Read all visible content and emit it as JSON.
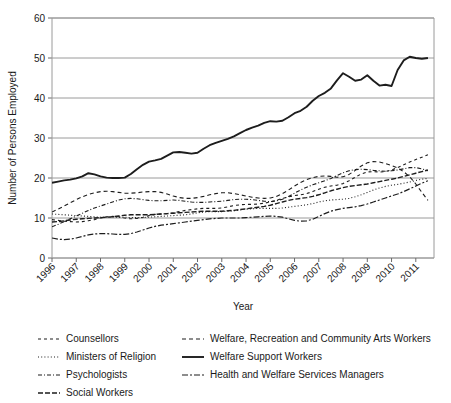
{
  "chart_data": {
    "type": "line",
    "title": "",
    "xlabel": "Year",
    "ylabel": "Number of Persons Employed",
    "xlim": [
      1996,
      2011.75
    ],
    "ylim": [
      0,
      60
    ],
    "yticks": [
      0,
      10,
      20,
      30,
      40,
      50,
      60
    ],
    "xticks": [
      1996,
      1997,
      1998,
      1999,
      2000,
      2001,
      2002,
      2003,
      2004,
      2005,
      2006,
      2007,
      2008,
      2009,
      2010,
      2011
    ],
    "grid": "horizontal",
    "legend_position": "below",
    "x": [
      1996,
      1996.25,
      1996.5,
      1996.75,
      1997,
      1997.25,
      1997.5,
      1997.75,
      1998,
      1998.25,
      1998.5,
      1998.75,
      1999,
      1999.25,
      1999.5,
      1999.75,
      2000,
      2000.25,
      2000.5,
      2000.75,
      2001,
      2001.25,
      2001.5,
      2001.75,
      2002,
      2002.25,
      2002.5,
      2002.75,
      2003,
      2003.25,
      2003.5,
      2003.75,
      2004,
      2004.25,
      2004.5,
      2004.75,
      2005,
      2005.25,
      2005.5,
      2005.75,
      2006,
      2006.25,
      2006.5,
      2006.75,
      2007,
      2007.25,
      2007.5,
      2007.75,
      2008,
      2008.25,
      2008.5,
      2008.75,
      2009,
      2009.25,
      2009.5,
      2009.75,
      2010,
      2010.25,
      2010.5,
      2010.75,
      2011,
      2011.25,
      2011.5
    ],
    "series": [
      {
        "name": "Counsellors",
        "dash": "3,3",
        "width": 1.1,
        "values": [
          9.6,
          9.4,
          9.2,
          9.1,
          9.0,
          9.1,
          9.3,
          9.6,
          10.0,
          10.3,
          10.4,
          10.3,
          10.0,
          9.8,
          9.9,
          10.2,
          10.6,
          10.9,
          11.0,
          11.1,
          11.3,
          11.6,
          11.9,
          12.1,
          12.3,
          12.4,
          12.4,
          12.4,
          12.5,
          12.8,
          13.1,
          13.3,
          13.4,
          13.4,
          13.5,
          13.7,
          14.0,
          14.4,
          14.9,
          15.3,
          15.6,
          15.8,
          16.1,
          16.6,
          17.2,
          17.7,
          18.0,
          18.2,
          18.6,
          19.3,
          20.2,
          21.0,
          21.5,
          21.6,
          21.5,
          21.6,
          22.0,
          22.6,
          23.3,
          24.0,
          24.6,
          25.2,
          25.8
        ]
      },
      {
        "name": "Ministers of Religion",
        "dash": "1,2.2",
        "width": 1.1,
        "values": [
          11.0,
          10.9,
          10.8,
          10.7,
          10.6,
          10.5,
          10.4,
          10.3,
          10.2,
          10.2,
          10.2,
          10.2,
          10.2,
          10.1,
          10.1,
          10.1,
          10.2,
          10.3,
          10.4,
          10.5,
          10.6,
          10.7,
          10.8,
          11.0,
          11.3,
          11.5,
          11.6,
          11.6,
          11.6,
          11.7,
          11.8,
          12.0,
          12.2,
          12.3,
          12.4,
          12.4,
          12.4,
          12.4,
          12.5,
          12.7,
          12.9,
          13.1,
          13.3,
          13.6,
          14.0,
          14.3,
          14.5,
          14.6,
          14.7,
          14.9,
          15.3,
          15.8,
          16.4,
          17.0,
          17.5,
          17.9,
          18.2,
          18.4,
          18.7,
          19.0,
          19.4,
          19.7,
          19.9
        ]
      },
      {
        "name": "Psychologists",
        "dash": "4,2,1,2",
        "width": 1.1,
        "values": [
          7.8,
          8.4,
          9.1,
          9.8,
          10.5,
          11.2,
          11.9,
          12.5,
          13.0,
          13.5,
          14.0,
          14.5,
          14.8,
          14.9,
          14.8,
          14.6,
          14.4,
          14.3,
          14.3,
          14.4,
          14.5,
          14.4,
          14.2,
          14.0,
          13.9,
          13.9,
          14.0,
          14.1,
          14.2,
          14.4,
          14.6,
          14.7,
          14.7,
          14.6,
          14.4,
          14.2,
          14.1,
          14.3,
          14.7,
          15.4,
          16.2,
          17.0,
          17.7,
          18.3,
          18.8,
          19.3,
          19.9,
          20.6,
          21.3,
          21.8,
          22.1,
          22.2,
          22.1,
          21.9,
          21.8,
          21.7,
          21.8,
          22.0,
          22.3,
          22.6,
          22.6,
          22.3,
          21.8
        ]
      },
      {
        "name": "Social Workers",
        "dash": "5,2",
        "width": 1.4,
        "values": [
          9.0,
          9.1,
          9.3,
          9.5,
          9.7,
          9.8,
          9.9,
          10.0,
          10.1,
          10.2,
          10.3,
          10.5,
          10.7,
          10.8,
          10.8,
          10.8,
          10.8,
          10.9,
          11.0,
          11.1,
          11.2,
          11.3,
          11.4,
          11.5,
          11.6,
          11.7,
          11.7,
          11.7,
          11.7,
          11.8,
          11.9,
          12.1,
          12.3,
          12.5,
          12.7,
          12.9,
          13.2,
          13.6,
          14.0,
          14.4,
          14.7,
          14.9,
          15.1,
          15.4,
          15.8,
          16.3,
          16.8,
          17.2,
          17.6,
          17.9,
          18.1,
          18.3,
          18.5,
          18.8,
          19.1,
          19.4,
          19.7,
          20.0,
          20.4,
          20.8,
          21.2,
          21.6,
          22.0
        ]
      },
      {
        "name": "Welfare, Recreation and Community Arts Workers",
        "dash": "4,3",
        "width": 1.1,
        "values": [
          11.5,
          12.2,
          13.0,
          13.8,
          14.6,
          15.3,
          15.9,
          16.3,
          16.6,
          16.7,
          16.6,
          16.4,
          16.2,
          16.2,
          16.3,
          16.5,
          16.6,
          16.6,
          16.4,
          16.0,
          15.5,
          15.1,
          14.9,
          14.9,
          15.1,
          15.4,
          15.8,
          16.1,
          16.3,
          16.3,
          16.1,
          15.8,
          15.5,
          15.2,
          15.0,
          14.9,
          15.0,
          15.4,
          16.1,
          17.0,
          18.0,
          18.9,
          19.6,
          20.1,
          20.4,
          20.5,
          20.4,
          20.2,
          20.3,
          20.9,
          21.9,
          23.0,
          23.8,
          24.1,
          24.0,
          23.6,
          23.1,
          22.5,
          21.6,
          20.3,
          18.5,
          16.4,
          14.4
        ]
      },
      {
        "name": "Welfare Support Workers",
        "dash": "0",
        "width": 1.9,
        "values": [
          18.8,
          19.1,
          19.4,
          19.6,
          19.9,
          20.4,
          21.2,
          20.9,
          20.4,
          20.1,
          20.0,
          20.0,
          20.1,
          21.0,
          22.2,
          23.3,
          24.1,
          24.4,
          24.8,
          25.6,
          26.4,
          26.5,
          26.3,
          26.1,
          26.3,
          27.3,
          28.2,
          28.8,
          29.3,
          29.8,
          30.4,
          31.2,
          32.0,
          32.6,
          33.1,
          33.8,
          34.2,
          34.1,
          34.3,
          35.2,
          36.2,
          36.8,
          37.8,
          39.3,
          40.5,
          41.3,
          42.4,
          44.4,
          46.2,
          45.3,
          44.3,
          44.6,
          45.7,
          44.3,
          43.1,
          43.3,
          43.0,
          47.0,
          49.4,
          50.3,
          50.0,
          49.8,
          50.0
        ]
      },
      {
        "name": "Health and Welfare Services Managers",
        "dash": "6,2,2,2",
        "width": 1.2,
        "values": [
          5.0,
          4.7,
          4.6,
          4.7,
          5.0,
          5.4,
          5.8,
          6.0,
          6.1,
          6.1,
          6.0,
          5.9,
          5.9,
          6.1,
          6.5,
          7.0,
          7.5,
          7.9,
          8.2,
          8.4,
          8.6,
          8.8,
          9.0,
          9.2,
          9.4,
          9.6,
          9.8,
          9.9,
          10.0,
          10.0,
          10.0,
          10.0,
          10.1,
          10.2,
          10.3,
          10.4,
          10.5,
          10.4,
          10.2,
          9.8,
          9.4,
          9.2,
          9.3,
          9.7,
          10.4,
          11.1,
          11.7,
          12.1,
          12.4,
          12.6,
          12.8,
          13.1,
          13.5,
          14.0,
          14.5,
          15.0,
          15.5,
          16.0,
          16.6,
          17.3,
          18.0,
          18.7,
          19.3
        ]
      }
    ]
  },
  "legend": {
    "column_left": [
      "Counsellors",
      "Ministers of Religion",
      "Psychologists",
      "Social Workers"
    ],
    "column_right": [
      "Welfare, Recreation and Community Arts Workers",
      "Welfare Support Workers",
      "Health and Welfare Services Managers"
    ]
  },
  "colors": {
    "line": "#1d1d1d",
    "grid": "#9a9a9a",
    "text": "#1a1a1a",
    "background": "#ffffff"
  }
}
